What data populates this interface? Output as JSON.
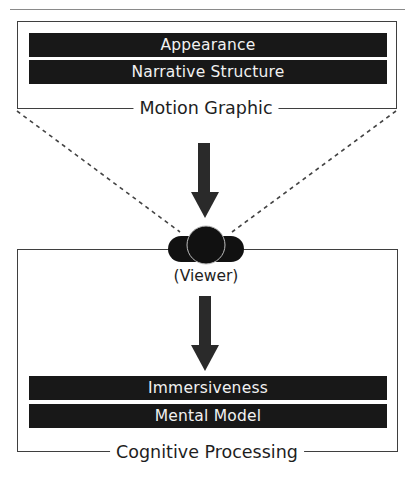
{
  "diagram": {
    "top_section": {
      "caption": "Motion Graphic",
      "bars": [
        {
          "label": "Appearance"
        },
        {
          "label": "Narrative Structure"
        }
      ]
    },
    "viewer": {
      "label": "(Viewer)",
      "icon": "person-icon"
    },
    "bottom_section": {
      "caption": "Cognitive Processing",
      "bars": [
        {
          "label": "Immersiveness"
        },
        {
          "label": "Mental Model"
        }
      ]
    },
    "flow": [
      {
        "from": "Motion Graphic",
        "to": "Viewer",
        "icon": "arrow-down-icon"
      },
      {
        "from": "Viewer",
        "to": "Cognitive Processing",
        "icon": "arrow-down-icon"
      }
    ],
    "colors": {
      "bar_fill": "#181818",
      "bar_text": "#f1f1f1",
      "frame_line": "#3f3f3f",
      "arrow_fill": "#2a2a2a"
    }
  }
}
